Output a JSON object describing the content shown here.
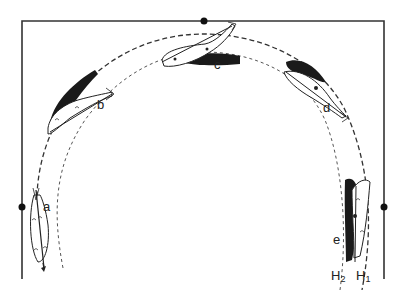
{
  "diagram": {
    "type": "arena-path-illustration",
    "frame": {
      "left_x": 22,
      "top_y": 21,
      "right_x": 384,
      "bottom_y": 279
    },
    "markers": [
      {
        "name": "top-marker",
        "x": 204,
        "y": 21
      },
      {
        "name": "left-marker",
        "x": 22,
        "y": 207
      },
      {
        "name": "right-marker",
        "x": 384,
        "y": 207
      }
    ],
    "tracks": [
      {
        "id": "H1",
        "label": "H",
        "sub": "1",
        "style": "dashed-outer"
      },
      {
        "id": "H2",
        "label": "H",
        "sub": "2",
        "style": "dashed-inner"
      }
    ],
    "positions": [
      {
        "id": "a",
        "label": "a",
        "x": 43,
        "y": 200
      },
      {
        "id": "b",
        "label": "b",
        "x": 97,
        "y": 98
      },
      {
        "id": "c",
        "label": "c",
        "x": 214,
        "y": 58
      },
      {
        "id": "d",
        "label": "d",
        "x": 323,
        "y": 101
      },
      {
        "id": "e",
        "label": "e",
        "x": 333,
        "y": 233
      }
    ],
    "colors": {
      "ink": "#222222",
      "fill_dark": "#1a1a1a",
      "fill_mid": "#555555",
      "background": "#ffffff"
    }
  }
}
